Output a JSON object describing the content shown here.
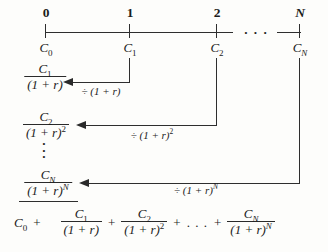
{
  "colors": {
    "ink": "#1c1c1c",
    "line": "#2e2e2e",
    "background": "#fdfdfb"
  },
  "timeline": {
    "ellipsis": "· · ·",
    "tick0": {
      "label": "0",
      "cash": "C",
      "cash_sub": "0"
    },
    "tick1": {
      "label": "1",
      "cash": "C",
      "cash_sub": "1"
    },
    "tick2": {
      "label": "2",
      "cash": "C",
      "cash_sub": "2"
    },
    "tickN": {
      "label": "N",
      "cash": "C",
      "cash_sub": "N"
    }
  },
  "discount_rows": {
    "row1": {
      "num": "C",
      "num_sub": "1",
      "den": "(1 + r)",
      "den_sup": "",
      "op": "÷ (1 + r)",
      "op_sup": ""
    },
    "row2": {
      "num": "C",
      "num_sub": "2",
      "den": "(1 + r)",
      "den_sup": "2",
      "op": "÷ (1 + r)",
      "op_sup": "2"
    },
    "rowN": {
      "num": "C",
      "num_sub": "N",
      "den": "(1 + r)",
      "den_sup": "N",
      "op": "÷ (1 + r)",
      "op_sup": "N"
    }
  },
  "vdots": "·\n·\n·",
  "result": {
    "lead": "C",
    "lead_sub": "0",
    "plus1": "+",
    "plus2": "+",
    "plus3": "+",
    "plus4": "+",
    "dots": ". . .",
    "frac1": {
      "num": "C",
      "num_sub": "1",
      "den": "(1 + r)",
      "den_sup": ""
    },
    "frac2": {
      "num": "C",
      "num_sub": "2",
      "den": "(1 + r)",
      "den_sup": "2"
    },
    "fracN": {
      "num": "C",
      "num_sub": "N",
      "den": "(1 + r)",
      "den_sup": "N"
    }
  }
}
